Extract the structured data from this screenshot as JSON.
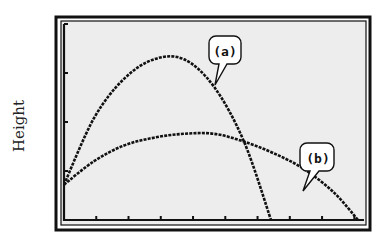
{
  "chart_data": {
    "type": "line",
    "title": "",
    "xlabel": "",
    "ylabel": "Height",
    "grid": false,
    "legend": "callouts",
    "xlim": [
      0,
      10
    ],
    "ylim": [
      0,
      5
    ],
    "x_ticks_count": 9,
    "y_ticks_count": 4,
    "series": [
      {
        "name": "(a)",
        "description": "higher, narrower parabolic trajectory",
        "x": [
          0,
          1,
          2,
          3,
          4,
          5,
          6,
          6.9
        ],
        "y": [
          0.9,
          2.6,
          3.6,
          4.1,
          4.1,
          3.4,
          2.0,
          0
        ]
      },
      {
        "name": "(b)",
        "description": "lower, wider parabolic trajectory",
        "x": [
          0,
          1,
          2,
          3,
          4,
          5,
          6,
          7,
          8,
          9,
          9.8
        ],
        "y": [
          0.9,
          1.5,
          1.9,
          2.1,
          2.2,
          2.2,
          2.0,
          1.7,
          1.3,
          0.7,
          0
        ]
      }
    ],
    "annotations": [
      {
        "text": "(a)",
        "points_to": "series a descending branch"
      },
      {
        "text": "(b)",
        "points_to": "series b descending branch"
      }
    ]
  },
  "labels": {
    "y_axis": "Height",
    "callout_a": "(a)",
    "callout_b": "(b)"
  },
  "colors": {
    "screen_bg": "#ededed",
    "ink": "#111111"
  }
}
